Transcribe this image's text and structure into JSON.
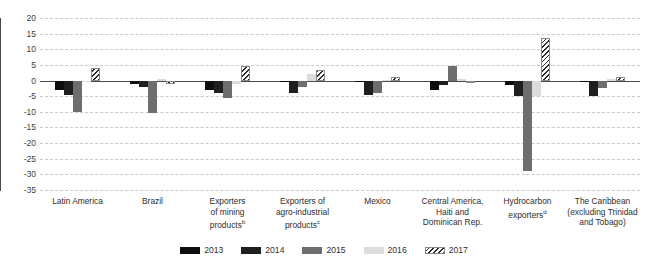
{
  "chart_data": {
    "type": "bar",
    "title": "",
    "subtitle": "",
    "xlabel": "",
    "ylabel": "",
    "ylim": [
      -35,
      20
    ],
    "yticks": [
      20,
      15,
      10,
      5,
      0,
      -5,
      -10,
      -15,
      -20,
      -25,
      -30,
      -35
    ],
    "ytick_labels": [
      "20",
      "15",
      "10",
      "5",
      "0",
      "-5",
      "-10",
      "-15",
      "-20",
      "-25",
      "-30",
      "-35"
    ],
    "grid": true,
    "legend_position": "bottom",
    "categories": [
      "Latin America",
      "Brazil",
      "Exporters of mining productsᵇ",
      "Exporters of agro-industrial productsᶜ",
      "Mexico",
      "Central America, Haiti and Dominican Rep.",
      "Hydrocarbon exportersᵈ",
      "The Caribbean (excluding Trinidad and Tobago)"
    ],
    "category_lines": [
      [
        "Latin America"
      ],
      [
        "Brazil"
      ],
      [
        "Exporters",
        "of mining",
        "products<sup>b</sup>"
      ],
      [
        "Exporters of",
        "agro-industrial",
        "products<sup>c</sup>"
      ],
      [
        "Mexico"
      ],
      [
        "Central America,",
        "Haiti and",
        "Dominican Rep."
      ],
      [
        "Hydrocarbon",
        "exporters<sup>d</sup>"
      ],
      [
        "The Caribbean",
        "(excluding Trinidad",
        "and Tobago)"
      ]
    ],
    "series": [
      {
        "name": "2013",
        "color": "#0d0d0d",
        "pattern": "solid",
        "values": [
          -3.0,
          -1.0,
          -3.0,
          -0.5,
          -0.2,
          -3.0,
          -1.5,
          -0.5
        ]
      },
      {
        "name": "2014",
        "color": "#1f1f1f",
        "pattern": "solid",
        "values": [
          -4.5,
          -2.0,
          -4.0,
          -4.0,
          -4.5,
          -1.5,
          -5.0,
          -5.0
        ]
      },
      {
        "name": "2015",
        "color": "#6e6e6e",
        "pattern": "solid",
        "values": [
          -10.0,
          -10.5,
          -5.5,
          -2.0,
          -4.0,
          4.5,
          -29.0,
          -2.5
        ]
      },
      {
        "name": "2016",
        "color": "#dcdcdc",
        "pattern": "solid",
        "values": [
          -0.3,
          0.5,
          -1.0,
          2.0,
          0.2,
          0.5,
          -5.0,
          0.5
        ]
      },
      {
        "name": "2017",
        "color": "#ffffff",
        "pattern": "diagonal-hatch",
        "values": [
          4.0,
          -1.0,
          4.5,
          3.5,
          1.0,
          -0.5,
          13.5,
          1.0
        ]
      }
    ]
  },
  "legend": {
    "items": [
      {
        "label": "2013"
      },
      {
        "label": "2014"
      },
      {
        "label": "2015"
      },
      {
        "label": "2016"
      },
      {
        "label": "2017"
      }
    ]
  }
}
